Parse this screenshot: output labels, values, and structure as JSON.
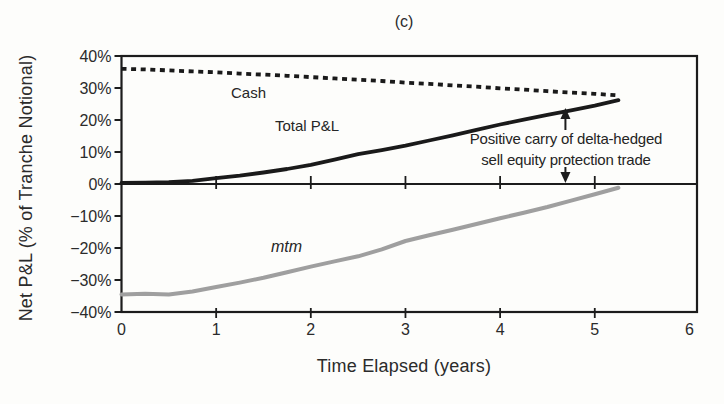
{
  "figure": {
    "title": "(c)",
    "x_axis_title": "Time Elapsed (years)",
    "y_axis_title": "Net P&L (% of Tranche Notional)"
  },
  "series_labels": {
    "cash": "Cash",
    "total_pnl": "Total P&L",
    "mtm": "mtm"
  },
  "annotation": {
    "line1": "Positive carry of delta-hedged",
    "line2": "sell equity protection trade",
    "arrow_x_years": 4.69
  },
  "colors": {
    "axis": "#1c1c1c",
    "text": "#2b2b2b",
    "cash_line": "#1a1a1a",
    "total_pnl_line": "#1a1a1a",
    "mtm_line": "#9f9f9f",
    "background": "#fdfdfb"
  },
  "chart_data": {
    "type": "line",
    "title": "(c)",
    "xlabel": "Time Elapsed (years)",
    "ylabel": "Net P&L (% of Tranche Notional)",
    "xlim": [
      0,
      6.08
    ],
    "ylim": [
      -40,
      40
    ],
    "grid": false,
    "legend_position": "inline-labels",
    "xticks": [
      0,
      1,
      2,
      3,
      4,
      5,
      6
    ],
    "xtick_minor_marks": [
      1,
      2,
      3,
      4,
      5
    ],
    "ytick_values": [
      40,
      30,
      20,
      10,
      0,
      -10,
      -20,
      -30,
      -40
    ],
    "ytick_labels": [
      "40%",
      "30%",
      "20%",
      "10%",
      "0%",
      "−10%",
      "−20%",
      "−30%",
      "−40%"
    ],
    "x": [
      0,
      0.25,
      0.5,
      0.75,
      1,
      1.25,
      1.5,
      1.75,
      2,
      2.25,
      2.5,
      2.75,
      3,
      3.25,
      3.5,
      3.75,
      4,
      4.25,
      4.5,
      4.75,
      5,
      5.25
    ],
    "series": [
      {
        "name": "Cash",
        "style": "dotted",
        "color": "#1a1a1a",
        "values": [
          36.0,
          35.8,
          35.5,
          35.2,
          34.9,
          34.5,
          34.2,
          33.8,
          33.4,
          33.0,
          32.6,
          32.2,
          31.7,
          31.3,
          30.8,
          30.4,
          29.9,
          29.5,
          29.0,
          28.6,
          28.2,
          27.7
        ]
      },
      {
        "name": "Total P&L",
        "style": "solid",
        "color": "#1a1a1a",
        "values": [
          0.3,
          0.4,
          0.6,
          1.0,
          1.8,
          2.6,
          3.6,
          4.7,
          6.0,
          7.6,
          9.3,
          10.6,
          12.0,
          13.6,
          15.2,
          16.9,
          18.6,
          20.1,
          21.6,
          23.0,
          24.5,
          26.2
        ]
      },
      {
        "name": "mtm",
        "style": "solid",
        "color": "#9f9f9f",
        "values": [
          -34.5,
          -34.3,
          -34.5,
          -33.6,
          -32.2,
          -30.8,
          -29.3,
          -27.6,
          -25.8,
          -24.2,
          -22.6,
          -20.4,
          -17.8,
          -16.0,
          -14.3,
          -12.5,
          -10.7,
          -9.0,
          -7.2,
          -5.2,
          -3.2,
          -1.2
        ]
      }
    ]
  }
}
